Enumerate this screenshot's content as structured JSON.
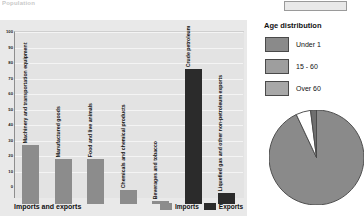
{
  "top_left_text": "Population",
  "bar_panel": {
    "title": "Imports and exports",
    "y_axis": {
      "ticks": [
        0,
        10,
        20,
        30,
        40,
        50,
        60,
        70,
        80,
        90,
        100
      ],
      "min": 0,
      "max": 100
    },
    "legend": [
      {
        "label": "Imports",
        "color": "#8c8c8c"
      },
      {
        "label": "Exports",
        "color": "#2b2b2b"
      }
    ]
  },
  "chart_data": {
    "type": "bar",
    "title": "Imports and exports",
    "xlabel": "",
    "ylabel": "",
    "ylim": [
      0,
      100
    ],
    "grid": true,
    "legend_position": "bottom-right",
    "categories": [
      "Machinery and transportation equipment",
      "Manufactured goods",
      "Food and live animals",
      "Chemicals and chemical products",
      "Beverages and tobacco",
      "Crude petroleum",
      "Liquefied gas and other non-petroleum exports"
    ],
    "series": [
      {
        "name": "Imports",
        "color": "#8c8c8c",
        "values": [
          38,
          29,
          29,
          9,
          2,
          0.5,
          0
        ]
      },
      {
        "name": "Exports",
        "color": "#2b2b2b",
        "values": [
          0,
          0,
          0,
          0,
          0,
          87,
          7
        ]
      }
    ]
  },
  "right_panel": {
    "age_title": "Age distribution",
    "age_legend": [
      {
        "label": "Under 1",
        "color": "#8a8a8a"
      },
      {
        "label": "15 - 60",
        "color": "#9e9e9e"
      },
      {
        "label": "Over 60",
        "color": "#a8a8a8"
      }
    ],
    "pie_chart": {
      "type": "pie",
      "title": "Age distribution",
      "slices": [
        {
          "label": "Under 1",
          "value": 93,
          "color": "#8a8a8a"
        },
        {
          "label": "15 - 60",
          "value": 5,
          "color": "#ffffff"
        },
        {
          "label": "Over 60",
          "value": 2,
          "color": "#6f6f6f"
        }
      ]
    }
  }
}
